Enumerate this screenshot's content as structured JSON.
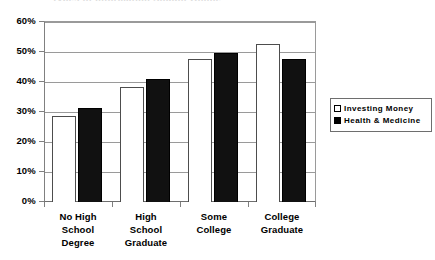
{
  "title_remnant": "Types of Information Sought Online",
  "chart_data": {
    "type": "bar",
    "title": "",
    "xlabel": "",
    "ylabel": "",
    "ylim": [
      0,
      60
    ],
    "grid": true,
    "legend_position": "right",
    "categories": [
      "No High School Degree",
      "High School Graduate",
      "Some College",
      "College Graduate"
    ],
    "category_lines": [
      [
        "No High",
        "School",
        "Degree"
      ],
      [
        "High",
        "School",
        "Graduate"
      ],
      [
        "Some",
        "College"
      ],
      [
        "College",
        "Graduate"
      ]
    ],
    "ytick_labels": [
      "60%",
      "50%",
      "40%",
      "30%",
      "20%",
      "10%",
      "0%"
    ],
    "ytick_values": [
      60,
      50,
      40,
      30,
      20,
      10,
      0
    ],
    "series": [
      {
        "name": "Investing Money",
        "color": "#ffffff",
        "border_color": "#4d4d4d",
        "values": [
          28.5,
          38.0,
          47.5,
          52.5
        ]
      },
      {
        "name": "Health & Medicine",
        "color": "#000000",
        "border_color": "#000000",
        "values": [
          31.3,
          40.7,
          49.4,
          47.5
        ]
      }
    ]
  },
  "legend": {
    "items": [
      {
        "label": "Investing Money",
        "swatch": "light"
      },
      {
        "label": "Health & Medicine",
        "swatch": "dark"
      }
    ]
  }
}
